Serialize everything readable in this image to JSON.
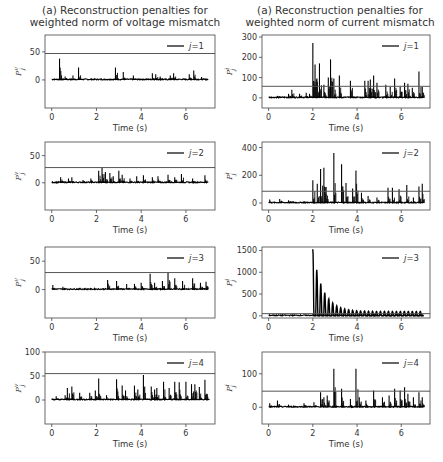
{
  "titles": {
    "left": [
      "(a) Reconstruction penalties for",
      "weighted norm of voltage mismatch"
    ],
    "right": [
      "(a) Reconstruction penalties for",
      "weighted norm of current mismatch"
    ]
  },
  "colors": {
    "series": "#000000",
    "threshold": "#555555",
    "axis": "#444444"
  },
  "chart_data": [
    {
      "type": "line",
      "panel": "left-1",
      "title": "(a) Reconstruction penalties for weighted norm of voltage mismatch",
      "xlabel": "Time (s)",
      "ylabel": "P_j^v",
      "legend": "j=1",
      "xlim": [
        -0.3,
        7.3
      ],
      "ylim": [
        -50,
        80
      ],
      "xticks": [
        0,
        2,
        4,
        6
      ],
      "yticks": [
        0,
        50
      ],
      "threshold": 47,
      "spikes": [
        [
          0.35,
          38
        ],
        [
          0.6,
          6
        ],
        [
          0.95,
          8
        ],
        [
          1.2,
          22
        ],
        [
          2.85,
          22
        ],
        [
          3.2,
          14
        ],
        [
          3.65,
          8
        ],
        [
          4.5,
          12
        ],
        [
          4.65,
          10
        ],
        [
          4.85,
          6
        ],
        [
          5.3,
          8
        ],
        [
          5.45,
          12
        ],
        [
          6.15,
          10
        ],
        [
          6.35,
          17
        ],
        [
          6.7,
          5
        ]
      ]
    },
    {
      "type": "line",
      "panel": "right-1",
      "title": "(a) Reconstruction penalties for weighted norm of current mismatch",
      "xlabel": "Time (s)",
      "ylabel": "P_j^i",
      "legend": "j=1",
      "xlim": [
        -0.3,
        7.3
      ],
      "ylim": [
        -50,
        310
      ],
      "xticks": [
        0,
        2,
        4,
        6
      ],
      "yticks": [
        0,
        100,
        200,
        300
      ],
      "threshold": 57,
      "spikes": [
        [
          0.4,
          10
        ],
        [
          0.9,
          20
        ],
        [
          1.05,
          40
        ],
        [
          1.4,
          20
        ],
        [
          1.7,
          25
        ],
        [
          1.85,
          20
        ],
        [
          2.0,
          270
        ],
        [
          2.1,
          165
        ],
        [
          2.2,
          80
        ],
        [
          2.3,
          170
        ],
        [
          2.5,
          65
        ],
        [
          2.7,
          100
        ],
        [
          2.8,
          190
        ],
        [
          2.95,
          95
        ],
        [
          3.2,
          110
        ],
        [
          3.7,
          85
        ],
        [
          4.35,
          85
        ],
        [
          4.5,
          85
        ],
        [
          4.6,
          90
        ],
        [
          4.75,
          110
        ],
        [
          4.9,
          75
        ],
        [
          5.3,
          65
        ],
        [
          5.5,
          55
        ],
        [
          5.7,
          95
        ],
        [
          5.95,
          55
        ],
        [
          6.15,
          75
        ],
        [
          6.3,
          70
        ],
        [
          6.5,
          50
        ],
        [
          6.8,
          130
        ],
        [
          6.95,
          55
        ]
      ]
    },
    {
      "type": "line",
      "panel": "left-2",
      "xlabel": "Time (s)",
      "ylabel": "P_j^v",
      "legend": "j=2",
      "xlim": [
        -0.3,
        7.3
      ],
      "ylim": [
        -50,
        75
      ],
      "xticks": [
        0,
        2,
        4,
        6
      ],
      "yticks": [
        0,
        50
      ],
      "threshold": 28,
      "spikes": [
        [
          0.4,
          10
        ],
        [
          0.75,
          8
        ],
        [
          0.9,
          10
        ],
        [
          1.4,
          5
        ],
        [
          1.75,
          8
        ],
        [
          2.1,
          22
        ],
        [
          2.25,
          28
        ],
        [
          2.4,
          20
        ],
        [
          2.6,
          18
        ],
        [
          2.75,
          12
        ],
        [
          3.0,
          22
        ],
        [
          3.15,
          15
        ],
        [
          3.5,
          8
        ],
        [
          3.8,
          12
        ],
        [
          4.1,
          14
        ],
        [
          4.5,
          10
        ],
        [
          4.75,
          12
        ],
        [
          5.2,
          15
        ],
        [
          5.5,
          10
        ],
        [
          5.8,
          16
        ],
        [
          6.3,
          8
        ],
        [
          6.85,
          14
        ]
      ]
    },
    {
      "type": "line",
      "panel": "right-2",
      "xlabel": "Time (s)",
      "ylabel": "P_j^i",
      "legend": "j=2",
      "xlim": [
        -0.3,
        7.3
      ],
      "ylim": [
        -50,
        440
      ],
      "xticks": [
        0,
        2,
        4,
        6
      ],
      "yticks": [
        0,
        200,
        400
      ],
      "threshold": 85,
      "spikes": [
        [
          0.05,
          25
        ],
        [
          0.5,
          30
        ],
        [
          0.9,
          20
        ],
        [
          1.1,
          15
        ],
        [
          1.6,
          15
        ],
        [
          2.0,
          165
        ],
        [
          2.2,
          140
        ],
        [
          2.35,
          245
        ],
        [
          2.5,
          255
        ],
        [
          2.6,
          115
        ],
        [
          2.95,
          360
        ],
        [
          3.3,
          280
        ],
        [
          3.5,
          145
        ],
        [
          3.8,
          105
        ],
        [
          3.95,
          235
        ],
        [
          4.2,
          75
        ],
        [
          4.5,
          50
        ],
        [
          4.9,
          40
        ],
        [
          5.4,
          110
        ],
        [
          5.6,
          110
        ],
        [
          5.9,
          100
        ],
        [
          6.25,
          130
        ],
        [
          6.55,
          40
        ],
        [
          6.8,
          120
        ],
        [
          6.95,
          140
        ]
      ]
    },
    {
      "type": "line",
      "panel": "left-3",
      "xlabel": "Time (s)",
      "ylabel": "P_j^v",
      "legend": "j=3",
      "xlim": [
        -0.3,
        7.3
      ],
      "ylim": [
        -50,
        75
      ],
      "xticks": [
        0,
        2,
        4,
        6
      ],
      "yticks": [
        0,
        50
      ],
      "threshold": 30,
      "spikes": [
        [
          0.05,
          8
        ],
        [
          0.5,
          5
        ],
        [
          2.5,
          17
        ],
        [
          2.9,
          15
        ],
        [
          3.35,
          10
        ],
        [
          3.7,
          10
        ],
        [
          4.0,
          12
        ],
        [
          4.4,
          28
        ],
        [
          4.6,
          12
        ],
        [
          4.95,
          15
        ],
        [
          5.2,
          30
        ],
        [
          5.5,
          20
        ],
        [
          5.85,
          15
        ],
        [
          6.3,
          20
        ],
        [
          6.65,
          12
        ],
        [
          6.9,
          14
        ]
      ]
    },
    {
      "type": "line",
      "panel": "right-3",
      "xlabel": "Time (s)",
      "ylabel": "P_j^i",
      "legend": "j=3",
      "xlim": [
        -0.3,
        7.3
      ],
      "ylim": [
        -50,
        1580
      ],
      "xticks": [
        0,
        2,
        4,
        6
      ],
      "yticks": [
        0,
        500,
        1000,
        1500
      ],
      "threshold": 50,
      "damped_oscillation": {
        "start": 2.0,
        "peak": 1530,
        "period": 0.18,
        "decay_to": 100,
        "end": 7.0
      }
    },
    {
      "type": "line",
      "panel": "left-4",
      "xlabel": "Time (s)",
      "ylabel": "P_j^v",
      "legend": "j=4",
      "xlim": [
        -0.3,
        7.3
      ],
      "ylim": [
        -50,
        100
      ],
      "xticks": [
        0,
        2,
        4,
        6
      ],
      "yticks": [
        0,
        50,
        100
      ],
      "threshold": 55,
      "spikes": [
        [
          0.2,
          8
        ],
        [
          0.6,
          10
        ],
        [
          0.7,
          25
        ],
        [
          0.9,
          28
        ],
        [
          1.25,
          15
        ],
        [
          1.7,
          15
        ],
        [
          1.95,
          20
        ],
        [
          2.1,
          45
        ],
        [
          2.45,
          10
        ],
        [
          2.9,
          43
        ],
        [
          3.15,
          30
        ],
        [
          3.3,
          20
        ],
        [
          3.7,
          30
        ],
        [
          3.85,
          22
        ],
        [
          4.1,
          52
        ],
        [
          4.45,
          28
        ],
        [
          4.6,
          22
        ],
        [
          4.7,
          25
        ],
        [
          5.0,
          38
        ],
        [
          5.25,
          25
        ],
        [
          5.5,
          38
        ],
        [
          5.7,
          37
        ],
        [
          6.0,
          38
        ],
        [
          6.25,
          33
        ],
        [
          6.4,
          33
        ],
        [
          6.6,
          27
        ],
        [
          6.85,
          42
        ],
        [
          6.95,
          12
        ]
      ]
    },
    {
      "type": "line",
      "panel": "right-4",
      "xlabel": "Time (s)",
      "ylabel": "P_j^i",
      "legend": "j=4",
      "xlim": [
        -0.3,
        7.3
      ],
      "ylim": [
        -50,
        165
      ],
      "xticks": [
        0,
        2,
        4,
        6
      ],
      "yticks": [
        0,
        100
      ],
      "threshold": 48,
      "spikes": [
        [
          0.05,
          12
        ],
        [
          0.4,
          20
        ],
        [
          0.9,
          8
        ],
        [
          1.6,
          12
        ],
        [
          2.05,
          15
        ],
        [
          2.35,
          45
        ],
        [
          2.5,
          30
        ],
        [
          2.65,
          35
        ],
        [
          2.95,
          115
        ],
        [
          3.3,
          55
        ],
        [
          3.7,
          25
        ],
        [
          3.95,
          115
        ],
        [
          4.1,
          30
        ],
        [
          4.4,
          20
        ],
        [
          4.75,
          50
        ],
        [
          5.15,
          30
        ],
        [
          5.45,
          35
        ],
        [
          5.7,
          55
        ],
        [
          5.95,
          50
        ],
        [
          6.15,
          60
        ],
        [
          6.3,
          40
        ],
        [
          6.55,
          30
        ],
        [
          6.8,
          45
        ],
        [
          6.95,
          30
        ]
      ]
    }
  ],
  "panels": [
    {
      "id": "left-1",
      "legend": "j=1",
      "xlabel": "Time (s)",
      "yticks": [
        "0",
        "50"
      ]
    },
    {
      "id": "right-1",
      "legend": "j=1",
      "xlabel": "Time (s)",
      "yticks": [
        "0",
        "100",
        "200",
        "300"
      ]
    },
    {
      "id": "left-2",
      "legend": "j=2",
      "xlabel": "Time (s)",
      "yticks": [
        "0",
        "50"
      ]
    },
    {
      "id": "right-2",
      "legend": "j=2",
      "xlabel": "Time (s)",
      "yticks": [
        "0",
        "200",
        "400"
      ]
    },
    {
      "id": "left-3",
      "legend": "j=3",
      "xlabel": "Time (s)",
      "yticks": [
        "0",
        "50"
      ]
    },
    {
      "id": "right-3",
      "legend": "j=3",
      "xlabel": "Time (s)",
      "yticks": [
        "0",
        "500",
        "1000",
        "1500"
      ]
    },
    {
      "id": "left-4",
      "legend": "j=4",
      "xlabel": "Time (s)",
      "yticks": [
        "0",
        "50",
        "100"
      ]
    },
    {
      "id": "right-4",
      "legend": "j=4",
      "xlabel": "Time (s)",
      "yticks": [
        "0",
        "100"
      ]
    }
  ],
  "xticks": [
    "0",
    "2",
    "4",
    "6"
  ]
}
